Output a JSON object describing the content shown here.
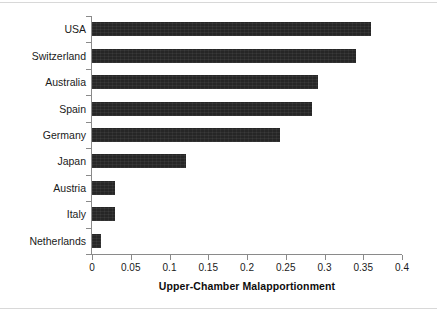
{
  "figure": {
    "width": 437,
    "height": 317,
    "background": "#ffffff",
    "bar_color": "#262626",
    "axis_color": "#8a8a8a",
    "text_color": "#1a1a1a"
  },
  "chart_data": {
    "type": "bar",
    "orientation": "horizontal",
    "title": "",
    "xlabel": "Upper-Chamber Malapportionment",
    "ylabel": "",
    "categories": [
      "USA",
      "Switzerland",
      "Australia",
      "Spain",
      "Germany",
      "Japan",
      "Austria",
      "Italy",
      "Netherlands"
    ],
    "values": [
      0.36,
      0.34,
      0.292,
      0.284,
      0.243,
      0.121,
      0.03,
      0.03,
      0.011
    ],
    "xlim": [
      0,
      0.4
    ],
    "xticks": [
      0,
      0.05,
      0.1,
      0.15,
      0.2,
      0.25,
      0.3,
      0.35,
      0.4
    ],
    "xticklabels": [
      "0",
      "0.05",
      "0.1",
      "0.15",
      "0.2",
      "0.25",
      "0.3",
      "0.35",
      "0.4"
    ],
    "grid": false,
    "legend": false
  }
}
